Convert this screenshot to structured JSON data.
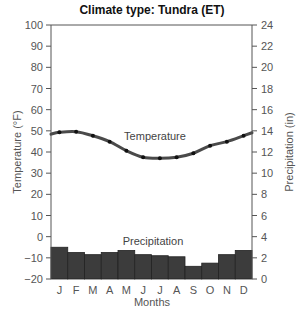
{
  "chart_data": {
    "type": "bar+line",
    "title": "Climate type: Tundra (ET)",
    "xlabel": "Months",
    "ylabel_left": "Temperature (°F)",
    "ylabel_right": "Precipitation (in)",
    "categories": [
      "J",
      "F",
      "M",
      "A",
      "M",
      "J",
      "J",
      "A",
      "S",
      "O",
      "N",
      "D"
    ],
    "series": [
      {
        "name": "Temperature",
        "type": "line",
        "axis": "left",
        "unit": "°F",
        "values": [
          49.3,
          49.6,
          47.7,
          44.9,
          40.6,
          37.5,
          37.0,
          37.5,
          39.4,
          43.0,
          44.9,
          47.7
        ]
      },
      {
        "name": "Precipitation",
        "type": "bar",
        "axis": "right",
        "unit": "in",
        "values": [
          3.0,
          2.5,
          2.3,
          2.5,
          2.7,
          2.3,
          2.2,
          2.1,
          1.2,
          1.5,
          2.3,
          2.7
        ]
      }
    ],
    "ylim_left": [
      -20,
      100
    ],
    "yticks_left": [
      -20,
      -10,
      0,
      10,
      20,
      30,
      40,
      50,
      60,
      70,
      80,
      90,
      100
    ],
    "ylim_right": [
      0,
      24
    ],
    "yticks_right": [
      0,
      2,
      4,
      6,
      8,
      10,
      12,
      14,
      16,
      18,
      20,
      22,
      24
    ],
    "annotations": [
      "Temperature",
      "Precipitation"
    ],
    "grid": false,
    "legend": "none (inline labels)"
  },
  "colors": {
    "bars": "#3c3c3c",
    "bar_edge": "#222222",
    "line": "#4a4a4a",
    "markers": "#111111",
    "axis": "#555555"
  }
}
